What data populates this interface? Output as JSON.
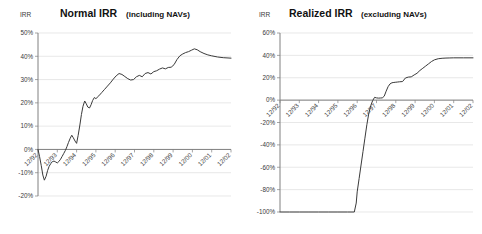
{
  "page": {
    "background": "#ffffff",
    "line_color": "#3a3a3a",
    "grid_color": "#d9d9d9",
    "axis_color": "#808080"
  },
  "charts": [
    {
      "id": "normal-irr",
      "title_main": "Normal IRR",
      "title_sub": "(including NAVs)",
      "axis_title": "IRR",
      "chart_data": {
        "type": "line",
        "title": "Normal IRR (including NAVs)",
        "xlabel": "",
        "ylabel": "IRR",
        "ylim": [
          -20,
          50
        ],
        "yticks": [
          50,
          40,
          30,
          20,
          10,
          0,
          -10,
          -20
        ],
        "ytick_labels": [
          "50%",
          "40%",
          "30%",
          "20%",
          "10%",
          "0%",
          "-10%",
          "-20%"
        ],
        "xlim": [
          "12/92",
          "12/02"
        ],
        "xticks": [
          "12/92",
          "12/93",
          "12/94",
          "12/95",
          "12/96",
          "12/97",
          "12/98",
          "12/99",
          "12/00",
          "12/01",
          "12/02"
        ],
        "grid": true,
        "legend": "none",
        "series": [
          {
            "name": "Normal IRR",
            "x": [
              0.0,
              0.08,
              0.17,
              0.25,
              0.33,
              0.42,
              0.5,
              0.58,
              0.67,
              0.75,
              0.83,
              0.92,
              1.0,
              1.08,
              1.17,
              1.25,
              1.33,
              1.42,
              1.5,
              1.58,
              1.67,
              1.75,
              1.83,
              1.92,
              2.0,
              2.08,
              2.17,
              2.25,
              2.33,
              2.42,
              2.5,
              2.58,
              2.67,
              2.75,
              2.83,
              2.92,
              3.0,
              3.15,
              3.3,
              3.45,
              3.6,
              3.75,
              3.9,
              4.05,
              4.2,
              4.35,
              4.5,
              4.65,
              4.8,
              4.95,
              5.1,
              5.25,
              5.4,
              5.55,
              5.7,
              5.85,
              6.0,
              6.15,
              6.3,
              6.45,
              6.6,
              6.75,
              6.9,
              7.05,
              7.2,
              7.35,
              7.5,
              7.65,
              7.8,
              7.95,
              8.1,
              8.25,
              8.4,
              8.6,
              8.8,
              9.0,
              9.3,
              9.6,
              10.0
            ],
            "y": [
              0.0,
              -3.0,
              -7.0,
              -11.0,
              -13.2,
              -11.5,
              -9.0,
              -7.2,
              -6.0,
              -5.2,
              -5.0,
              -5.4,
              -5.8,
              -5.2,
              -4.2,
              -3.0,
              -1.8,
              -0.4,
              1.2,
              3.0,
              4.8,
              6.1,
              5.0,
              3.6,
              2.6,
              6.0,
              10.5,
              15.0,
              18.5,
              20.8,
              19.6,
              18.2,
              17.8,
              19.2,
              21.0,
              22.3,
              21.8,
              23.0,
              24.4,
              25.8,
              27.2,
              28.6,
              30.2,
              31.6,
              32.6,
              32.2,
              31.3,
              30.4,
              29.8,
              30.0,
              31.2,
              31.8,
              31.2,
              32.6,
              33.0,
              32.4,
              33.4,
              33.8,
              34.5,
              35.0,
              34.6,
              35.2,
              35.3,
              36.4,
              38.6,
              40.2,
              41.0,
              41.6,
              42.0,
              42.6,
              43.2,
              42.8,
              42.0,
              41.2,
              40.6,
              40.2,
              39.7,
              39.4,
              39.2
            ]
          }
        ]
      }
    },
    {
      "id": "realized-irr",
      "title_main": "Realized IRR",
      "title_sub": "(excluding NAVs)",
      "axis_title": "IRR",
      "chart_data": {
        "type": "line",
        "title": "Realized IRR (excluding NAVs)",
        "xlabel": "",
        "ylabel": "IRR",
        "ylim": [
          -100,
          60
        ],
        "yticks": [
          60,
          40,
          20,
          0,
          -20,
          -40,
          -60,
          -80,
          -100
        ],
        "ytick_labels": [
          "60%",
          "40%",
          "20%",
          "0%",
          "-20%",
          "-40%",
          "-60%",
          "-80%",
          "-100%"
        ],
        "xlim": [
          "12/92",
          "12/02"
        ],
        "xticks": [
          "12/92",
          "12/93",
          "12/94",
          "12/95",
          "12/96",
          "12/97",
          "12/98",
          "12/99",
          "12/00",
          "12/01",
          "12/02"
        ],
        "grid": true,
        "legend": "none",
        "series": [
          {
            "name": "Realized IRR",
            "x": [
              0.0,
              0.5,
              1.0,
              1.5,
              2.0,
              2.5,
              3.0,
              3.5,
              3.85,
              3.95,
              4.0,
              4.1,
              4.2,
              4.3,
              4.4,
              4.5,
              4.6,
              4.7,
              4.8,
              4.9,
              5.0,
              5.1,
              5.2,
              5.3,
              5.4,
              5.5,
              5.6,
              5.7,
              5.8,
              5.9,
              6.0,
              6.1,
              6.2,
              6.35,
              6.5,
              6.65,
              6.8,
              6.95,
              7.1,
              7.25,
              7.4,
              7.55,
              7.7,
              7.85,
              8.0,
              8.2,
              8.4,
              8.6,
              8.8,
              9.0,
              9.5,
              10.0
            ],
            "y": [
              -100.0,
              -100.0,
              -100.0,
              -100.0,
              -100.0,
              -100.0,
              -100.0,
              -100.0,
              -100.0,
              -92.0,
              -82.0,
              -70.0,
              -58.0,
              -46.0,
              -34.0,
              -22.0,
              -12.0,
              -5.0,
              -0.5,
              2.5,
              2.0,
              1.8,
              1.9,
              2.0,
              3.5,
              8.0,
              12.0,
              14.5,
              15.5,
              15.8,
              16.0,
              16.2,
              16.4,
              16.6,
              19.8,
              20.6,
              20.8,
              22.5,
              24.0,
              26.5,
              28.5,
              30.5,
              32.5,
              34.5,
              36.0,
              37.0,
              37.4,
              37.6,
              37.7,
              37.8,
              37.8,
              37.8
            ]
          }
        ]
      }
    }
  ]
}
